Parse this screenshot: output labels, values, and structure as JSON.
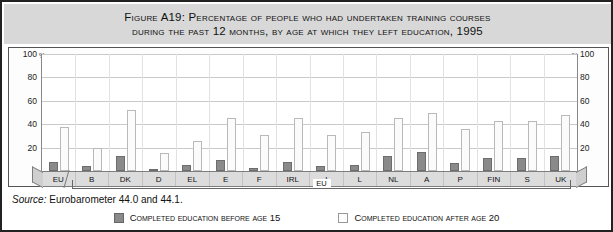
{
  "figure": {
    "title_line1": "Figure A19: Percentage of people who had undertaken training courses",
    "title_line2": "during the past 12 months, by age at which they left education, 1995",
    "source_label": "Source:",
    "source_text": " Eurobarometer 44.0 and 44.1.",
    "eu_bracket_label": "EU"
  },
  "legend": {
    "items": [
      {
        "label": "Completed education before age 15",
        "color": "#8a8a8a",
        "swatch": "dark-swatch"
      },
      {
        "label": "Completed education after age 20",
        "color": "#fdfdfd",
        "swatch": "light-swatch"
      }
    ]
  },
  "axis": {
    "unit": "%",
    "ticks": [
      100,
      80,
      60,
      40,
      20
    ]
  },
  "chart_data": {
    "type": "bar",
    "title": "Figure A19: Percentage of people who had undertaken training courses during the past 12 months, by age at which they left education, 1995",
    "xlabel": "",
    "ylabel": "%",
    "ylim": [
      0,
      100
    ],
    "yticks": [
      0,
      20,
      40,
      60,
      80,
      100
    ],
    "grid": true,
    "legend_position": "bottom",
    "categories": [
      "EU",
      "B",
      "DK",
      "D",
      "EL",
      "E",
      "F",
      "IRL",
      "I",
      "L",
      "NL",
      "A",
      "P",
      "FIN",
      "S",
      "UK"
    ],
    "series": [
      {
        "name": "Completed education before age 15",
        "color": "#8a8a8a",
        "values": [
          8,
          4,
          13,
          2,
          5,
          9,
          3,
          8,
          4,
          5,
          13,
          16,
          7,
          11,
          11,
          13
        ]
      },
      {
        "name": "Completed education after age 20",
        "color": "#fdfdfd",
        "values": [
          38,
          20,
          52,
          15,
          26,
          45,
          31,
          45,
          31,
          33,
          45,
          50,
          36,
          43,
          43,
          48
        ]
      }
    ]
  }
}
